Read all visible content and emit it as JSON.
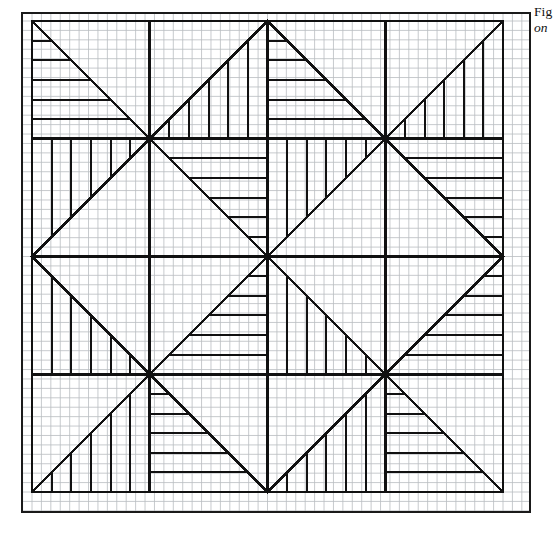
{
  "figure": {
    "caption_line1": "Fig",
    "caption_line2": "on",
    "paper": {
      "type": "graph-paper",
      "minor_grid_px": 9.42,
      "minor_grid_color": "#b9bcc0",
      "frame_color": "#1a1a1a",
      "frame": {
        "x": 22,
        "y": 13,
        "width": 508,
        "height": 499
      }
    },
    "drawing": {
      "origin_x": 32,
      "origin_y": 21,
      "unit_px": 9.42,
      "cells_across": 4,
      "cells_down": 4,
      "cell_units": 12.5,
      "stroke_color": "#111111",
      "bold_stroke_px": 2.6,
      "hatch_stroke_px": 2.0,
      "hatch_step_units": 2.0833,
      "description": "Four-by-four array of square cells. Each cell carries one main diagonal; the two triangular halves are hatched, one with horizontal rules and one with vertical rules, alternating across the array to form a pinwheel / star quilt block."
    },
    "cells": [
      {
        "row": 0,
        "col": 0,
        "diagonal": "tl-br",
        "hatch_upper": "horizontal",
        "hatch_lower": "none"
      },
      {
        "row": 0,
        "col": 1,
        "diagonal": "bl-tr",
        "hatch_upper": "none",
        "hatch_lower": "vertical"
      },
      {
        "row": 0,
        "col": 2,
        "diagonal": "tl-br",
        "hatch_upper": "horizontal",
        "hatch_lower": "none"
      },
      {
        "row": 0,
        "col": 3,
        "diagonal": "bl-tr",
        "hatch_upper": "none",
        "hatch_lower": "vertical"
      },
      {
        "row": 1,
        "col": 0,
        "diagonal": "bl-tr",
        "hatch_upper": "vertical",
        "hatch_lower": "none"
      },
      {
        "row": 1,
        "col": 1,
        "diagonal": "tl-br",
        "hatch_upper": "none",
        "hatch_lower": "horizontal"
      },
      {
        "row": 1,
        "col": 2,
        "diagonal": "bl-tr",
        "hatch_upper": "vertical",
        "hatch_lower": "none"
      },
      {
        "row": 1,
        "col": 3,
        "diagonal": "tl-br",
        "hatch_upper": "none",
        "hatch_lower": "horizontal"
      },
      {
        "row": 2,
        "col": 0,
        "diagonal": "tl-br",
        "hatch_upper": "none",
        "hatch_lower": "vertical"
      },
      {
        "row": 2,
        "col": 1,
        "diagonal": "bl-tr",
        "hatch_upper": "horizontal",
        "hatch_lower": "none"
      },
      {
        "row": 2,
        "col": 2,
        "diagonal": "tl-br",
        "hatch_upper": "none",
        "hatch_lower": "vertical"
      },
      {
        "row": 2,
        "col": 3,
        "diagonal": "bl-tr",
        "hatch_upper": "horizontal",
        "hatch_lower": "none"
      },
      {
        "row": 3,
        "col": 0,
        "diagonal": "bl-tr",
        "hatch_upper": "none",
        "hatch_lower": "vertical"
      },
      {
        "row": 3,
        "col": 1,
        "diagonal": "tl-br",
        "hatch_upper": "horizontal",
        "hatch_lower": "none"
      },
      {
        "row": 3,
        "col": 2,
        "diagonal": "bl-tr",
        "hatch_upper": "none",
        "hatch_lower": "vertical"
      },
      {
        "row": 3,
        "col": 3,
        "diagonal": "tl-br",
        "hatch_upper": "horizontal",
        "hatch_lower": "none"
      }
    ],
    "nodes": [
      {
        "name": "center",
        "x": 266,
        "y": 268
      },
      {
        "name": "upper-left",
        "x": 150,
        "y": 145
      },
      {
        "name": "upper-right",
        "x": 385,
        "y": 145
      },
      {
        "name": "lower-left",
        "x": 150,
        "y": 383
      },
      {
        "name": "lower-right",
        "x": 385,
        "y": 383
      },
      {
        "name": "corner-tl",
        "x": 32,
        "y": 21
      },
      {
        "name": "corner-tr",
        "x": 503,
        "y": 21
      },
      {
        "name": "corner-bl",
        "x": 32,
        "y": 500
      },
      {
        "name": "corner-br",
        "x": 503,
        "y": 500
      }
    ]
  }
}
